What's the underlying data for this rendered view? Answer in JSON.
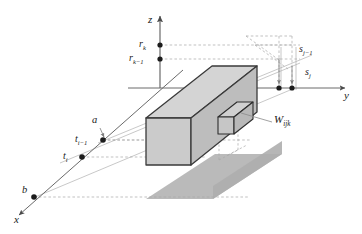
{
  "figure": {
    "kind": "3d-voxel-grid-diagram",
    "background": "#ffffff",
    "colors": {
      "ink": "#1a1a1a",
      "solid_line": "#333333",
      "guide_line": "#9a9a9a",
      "dashed_guide": "#a8a8a8",
      "slab_top": "#d2d2d2",
      "slab_front": "#c9c9c9",
      "slab_side": "#b9b9b9",
      "shadow": "#b4b4b4",
      "voxel_face": "#cfcfcf"
    }
  },
  "axes": {
    "z": {
      "label": "z",
      "direction": "up"
    },
    "y": {
      "label": "y",
      "direction": "right"
    },
    "x": {
      "label": "x",
      "direction": "down-left"
    }
  },
  "ticks": {
    "z_axis": [
      {
        "base": "r",
        "sub": "k",
        "text": "r"
      },
      {
        "base": "r",
        "sub": "k−1",
        "text": "r"
      }
    ],
    "y_axis": [
      {
        "base": "s",
        "sub": "j−1",
        "text": "s"
      },
      {
        "base": "s",
        "sub": "j",
        "text": "s"
      }
    ],
    "x_axis": [
      {
        "base": "t",
        "sub": "i−1",
        "text": "t"
      },
      {
        "base": "t",
        "sub": "i",
        "text": "t"
      }
    ]
  },
  "points": {
    "a": {
      "label": "a"
    },
    "b": {
      "label": "b"
    }
  },
  "voxel": {
    "base": "W",
    "sub": "ijk",
    "label": "W"
  }
}
